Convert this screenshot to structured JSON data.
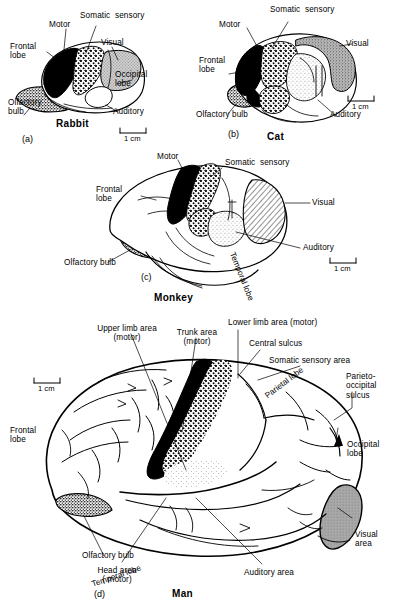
{
  "figure": {
    "type": "comparative-neuroanatomy-diagram",
    "scale_caption": "1 cm"
  },
  "panels": [
    {
      "id": "(a)",
      "species": "Rabbit",
      "labels": {
        "frontal_lobe": "Frontal\nlobe",
        "motor": "Motor",
        "somatic_sensory": "Somatic  sensory",
        "visual": "Visual",
        "occipital_lobe": "Occipital\nlobe",
        "auditory": "Auditory",
        "olfactory_bulb": "Olfactory\nbulb"
      },
      "scale": "1 cm"
    },
    {
      "id": "(b)",
      "species": "Cat",
      "labels": {
        "motor": "Motor",
        "somatic_sensory": "Somatic  sensory",
        "visual": "Visual",
        "frontal_lobe": "Frontal\nlobe",
        "auditory": "Auditory",
        "olfactory_bulb": "Olfactory bulb"
      },
      "scale": "1 cm"
    },
    {
      "id": "(c)",
      "species": "Monkey",
      "labels": {
        "motor": "Motor",
        "somatic_sensory": "Somatic  sensory",
        "frontal_lobe": "Frontal\nlobe",
        "visual": "Visual",
        "auditory": "Auditory",
        "olfactory_bulb": "Olfactory bulb",
        "temporal_lobe": "Temporal lobe"
      },
      "scale": "1 cm"
    },
    {
      "id": "(d)",
      "species": "Man",
      "labels": {
        "upper_limb_area": "Upper limb area\n(motor)",
        "trunk_area": "Trunk area\n(motor)",
        "lower_limb_area": "Lower limb area (motor)",
        "central_sulcus": "Central sulcus",
        "somatic_sensory_area": "Somatic sensory area",
        "parietal_lobe": "Parietal lobe",
        "parieto_occipital_sulcus": "Parieto-\noccipital\nsulcus",
        "occipital_lobe": "Occipital\nlobe",
        "visual_area": "Visual\narea",
        "auditory_area": "Auditory area",
        "temporal_lobe": "Temporal lobe",
        "head_area": "Head area\n( motor)",
        "olfactory_bulb": "Olfactory bulb",
        "frontal_lobe": "Frontal\nlobe"
      },
      "scale": "1 cm"
    }
  ],
  "legend_shading": {
    "motor": "solid-black",
    "somatic_sensory": "coarse-stipple",
    "visual": "gray-tone-or-hatch",
    "auditory": "fine-stipple",
    "olfactory_bulb": "dense-speckle"
  },
  "colors": {
    "ink": "#000000",
    "paper": "#ffffff",
    "gray_fill": "#9a9a9a",
    "light_gray_fill": "#d8d8d8"
  }
}
